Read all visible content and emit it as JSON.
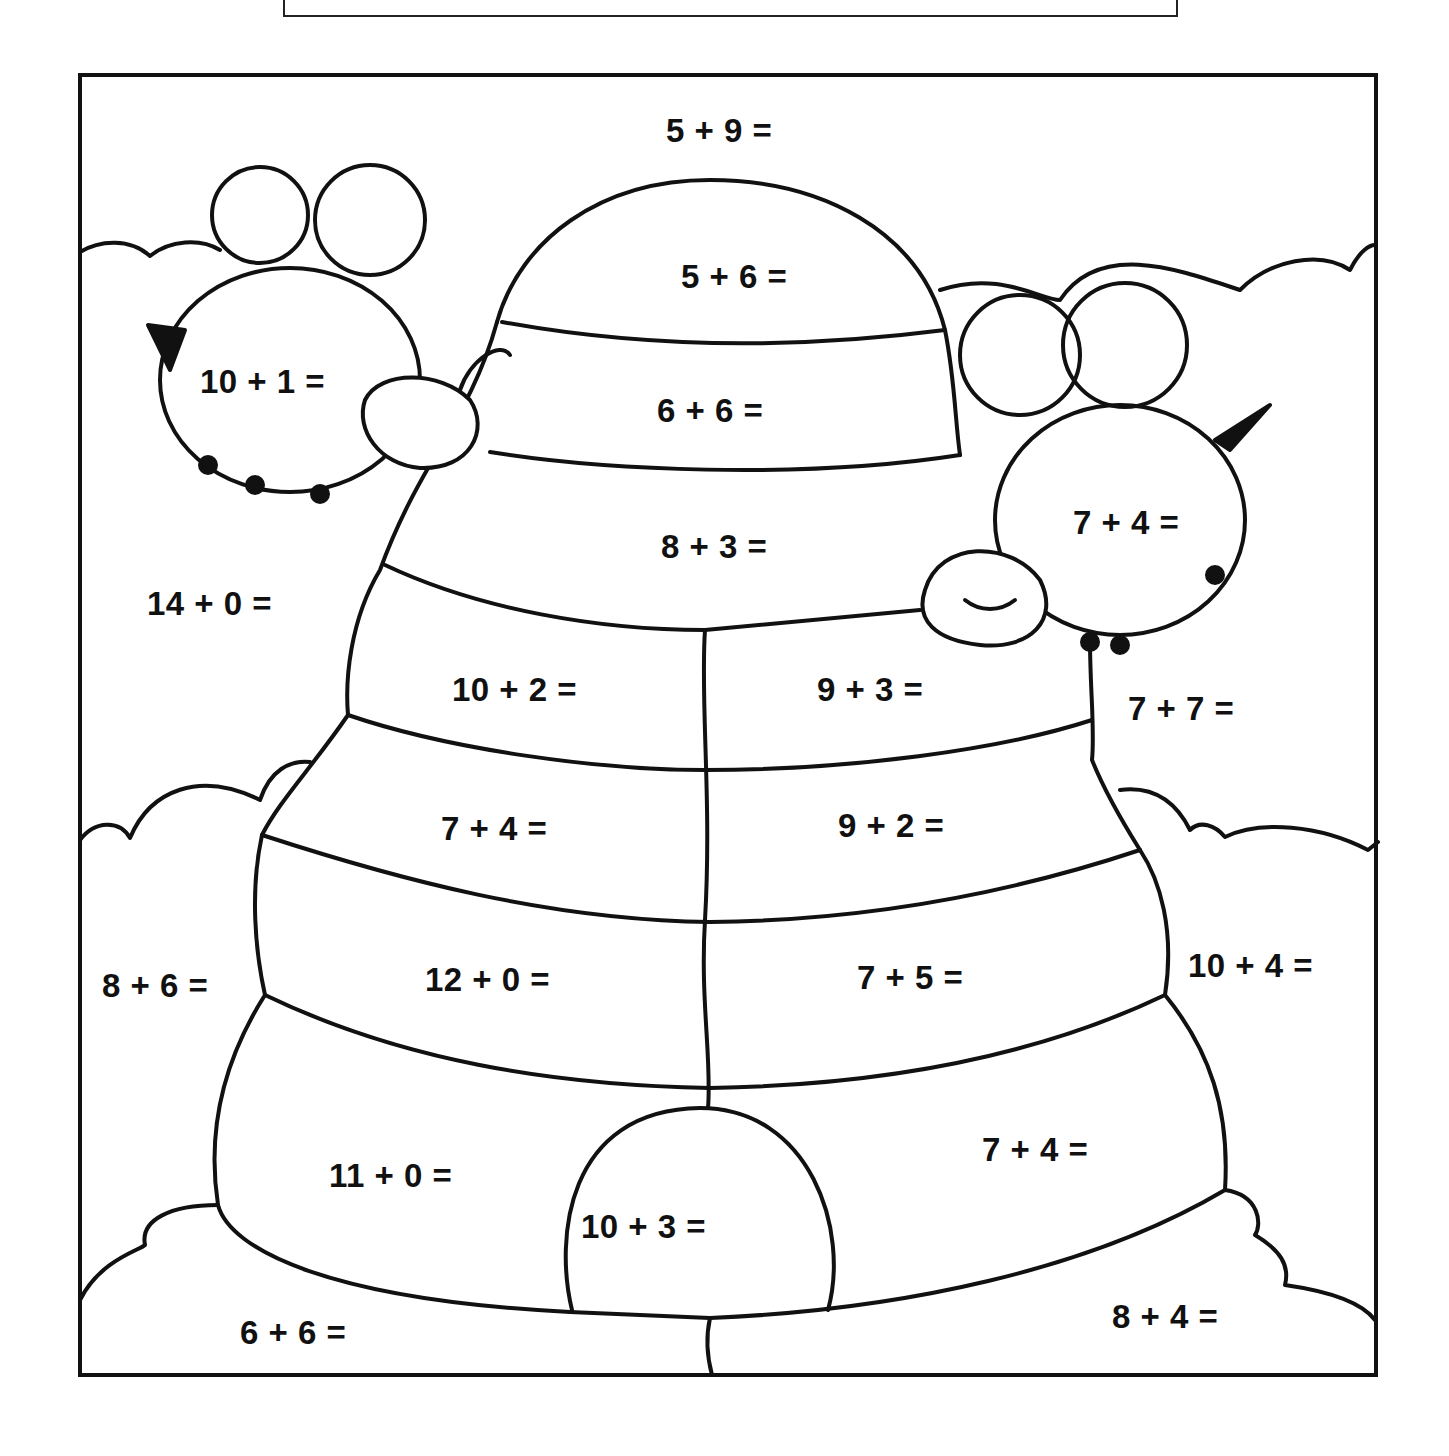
{
  "worksheet": {
    "name_box_label": "",
    "colors": {
      "ink": "#111111",
      "paper": "#ffffff"
    },
    "equations": [
      {
        "id": "top-sky",
        "text": "5 + 9 =",
        "x": 666,
        "y": 112
      },
      {
        "id": "hive-dome",
        "text": "5 + 6 =",
        "x": 681,
        "y": 258
      },
      {
        "id": "hive-band-2",
        "text": "6 + 6 =",
        "x": 657,
        "y": 392
      },
      {
        "id": "bee-left",
        "text": "10 + 1 =",
        "x": 200,
        "y": 363
      },
      {
        "id": "hive-band-3",
        "text": "8 + 3 =",
        "x": 661,
        "y": 528
      },
      {
        "id": "bee-right",
        "text": "7 + 4 =",
        "x": 1073,
        "y": 504
      },
      {
        "id": "left-sky",
        "text": "14 + 0 =",
        "x": 147,
        "y": 585
      },
      {
        "id": "hive-4-left",
        "text": "10 + 2 =",
        "x": 452,
        "y": 671
      },
      {
        "id": "hive-4-right",
        "text": "9 + 3 =",
        "x": 817,
        "y": 671
      },
      {
        "id": "right-sky",
        "text": "7 + 7 =",
        "x": 1128,
        "y": 690
      },
      {
        "id": "hive-5-left",
        "text": "7 + 4 =",
        "x": 441,
        "y": 810
      },
      {
        "id": "hive-5-right",
        "text": "9 + 2 =",
        "x": 838,
        "y": 807
      },
      {
        "id": "left-cloud",
        "text": "8 + 6 =",
        "x": 102,
        "y": 967
      },
      {
        "id": "hive-6-left",
        "text": "12 + 0 =",
        "x": 425,
        "y": 961
      },
      {
        "id": "hive-6-right",
        "text": "7 + 5 =",
        "x": 857,
        "y": 959
      },
      {
        "id": "right-cloud",
        "text": "10 + 4 =",
        "x": 1188,
        "y": 947
      },
      {
        "id": "hive-7-left",
        "text": "11 + 0 =",
        "x": 329,
        "y": 1157
      },
      {
        "id": "hive-7-right",
        "text": "7 + 4 =",
        "x": 982,
        "y": 1131
      },
      {
        "id": "hive-door",
        "text": "10 + 3 =",
        "x": 581,
        "y": 1208
      },
      {
        "id": "ground-left",
        "text": "6 + 6 =",
        "x": 240,
        "y": 1314
      },
      {
        "id": "ground-right",
        "text": "8 + 4 =",
        "x": 1112,
        "y": 1298
      }
    ]
  }
}
